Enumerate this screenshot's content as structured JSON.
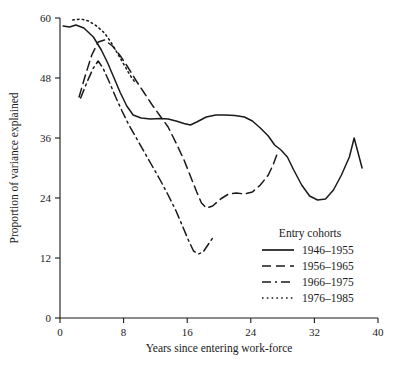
{
  "chart_data": {
    "type": "line",
    "title": "",
    "xlabel": "Years since entering work-force",
    "ylabel": "Proportion of variance explained",
    "xlim": [
      0,
      40
    ],
    "ylim": [
      0,
      60
    ],
    "xticks": [
      0,
      8,
      16,
      24,
      32,
      40
    ],
    "yticks": [
      0,
      12,
      24,
      36,
      48,
      60
    ],
    "xticklabels": [
      "0",
      "8",
      "16",
      "24",
      "32",
      "40"
    ],
    "yticklabels": [
      "0",
      "12",
      "24",
      "36",
      "48",
      "60"
    ],
    "grid": false,
    "legend_position": "lower right",
    "legend_title": "Entry cohorts",
    "series": [
      {
        "name": "1946–1955",
        "dash": "solid",
        "points": [
          [
            0.4,
            58.4
          ],
          [
            1.2,
            58.2
          ],
          [
            2.0,
            58.6
          ],
          [
            3.0,
            58.0
          ],
          [
            4.2,
            56.2
          ],
          [
            5.2,
            53.6
          ],
          [
            6.0,
            51.0
          ],
          [
            6.8,
            48.0
          ],
          [
            7.6,
            45.0
          ],
          [
            8.4,
            42.4
          ],
          [
            9.2,
            40.6
          ],
          [
            10.2,
            40.0
          ],
          [
            11.4,
            39.8
          ],
          [
            12.6,
            39.9
          ],
          [
            13.6,
            39.8
          ],
          [
            14.6,
            39.4
          ],
          [
            15.6,
            38.9
          ],
          [
            16.4,
            38.6
          ],
          [
            17.2,
            39.2
          ],
          [
            18.4,
            40.2
          ],
          [
            19.6,
            40.6
          ],
          [
            20.8,
            40.6
          ],
          [
            22.0,
            40.5
          ],
          [
            23.2,
            40.2
          ],
          [
            24.2,
            39.4
          ],
          [
            25.2,
            38.0
          ],
          [
            26.2,
            36.4
          ],
          [
            27.0,
            34.6
          ],
          [
            27.8,
            33.6
          ],
          [
            28.6,
            32.2
          ],
          [
            29.4,
            29.6
          ],
          [
            30.4,
            26.6
          ],
          [
            31.4,
            24.4
          ],
          [
            32.4,
            23.6
          ],
          [
            33.4,
            23.8
          ],
          [
            34.4,
            25.6
          ],
          [
            35.4,
            28.6
          ],
          [
            36.4,
            32.2
          ],
          [
            37.0,
            36.0
          ],
          [
            37.6,
            32.4
          ],
          [
            38.0,
            30.0
          ]
        ]
      },
      {
        "name": "1956–1965",
        "dash": "dashed",
        "points": [
          [
            2.4,
            44.2
          ],
          [
            3.2,
            48.6
          ],
          [
            4.0,
            52.6
          ],
          [
            4.8,
            55.2
          ],
          [
            5.6,
            55.6
          ],
          [
            6.6,
            54.4
          ],
          [
            7.6,
            52.4
          ],
          [
            8.6,
            50.0
          ],
          [
            9.6,
            47.4
          ],
          [
            10.6,
            45.0
          ],
          [
            11.6,
            42.6
          ],
          [
            12.6,
            40.4
          ],
          [
            13.6,
            38.2
          ],
          [
            14.6,
            35.0
          ],
          [
            15.6,
            31.6
          ],
          [
            16.4,
            28.4
          ],
          [
            17.2,
            25.2
          ],
          [
            17.8,
            23.0
          ],
          [
            18.4,
            22.0
          ],
          [
            19.2,
            22.4
          ],
          [
            20.2,
            23.8
          ],
          [
            21.2,
            24.8
          ],
          [
            22.2,
            25.0
          ],
          [
            23.2,
            24.8
          ],
          [
            24.2,
            25.2
          ],
          [
            25.2,
            26.6
          ],
          [
            26.2,
            28.6
          ],
          [
            26.8,
            30.6
          ],
          [
            27.4,
            33.2
          ]
        ]
      },
      {
        "name": "1966–1975",
        "dash": "dashdot",
        "points": [
          [
            2.6,
            44.0
          ],
          [
            3.4,
            47.2
          ],
          [
            4.2,
            50.0
          ],
          [
            4.8,
            51.4
          ],
          [
            5.4,
            50.0
          ],
          [
            6.2,
            47.2
          ],
          [
            7.0,
            44.2
          ],
          [
            7.8,
            41.4
          ],
          [
            8.6,
            38.8
          ],
          [
            9.6,
            36.0
          ],
          [
            10.6,
            33.2
          ],
          [
            11.6,
            30.4
          ],
          [
            12.6,
            27.6
          ],
          [
            13.6,
            24.6
          ],
          [
            14.6,
            21.4
          ],
          [
            15.4,
            18.4
          ],
          [
            16.2,
            15.4
          ],
          [
            16.8,
            13.4
          ],
          [
            17.4,
            12.8
          ],
          [
            18.0,
            13.2
          ],
          [
            18.6,
            14.6
          ],
          [
            19.2,
            16.0
          ]
        ]
      },
      {
        "name": "1976–1985",
        "dash": "dotted",
        "points": [
          [
            1.6,
            59.6
          ],
          [
            2.6,
            59.8
          ],
          [
            3.6,
            59.4
          ],
          [
            4.6,
            58.4
          ],
          [
            5.6,
            57.0
          ],
          [
            6.4,
            55.2
          ],
          [
            7.2,
            53.0
          ],
          [
            8.0,
            50.8
          ],
          [
            8.8,
            48.6
          ],
          [
            9.4,
            47.2
          ]
        ]
      }
    ]
  },
  "legend": {
    "title": "Entry cohorts",
    "items": [
      {
        "label": "1946–1955",
        "style": "solid"
      },
      {
        "label": "1956–1965",
        "style": "dashed"
      },
      {
        "label": "1966–1975",
        "style": "dashdot"
      },
      {
        "label": "1976–1985",
        "style": "dotted"
      }
    ]
  }
}
